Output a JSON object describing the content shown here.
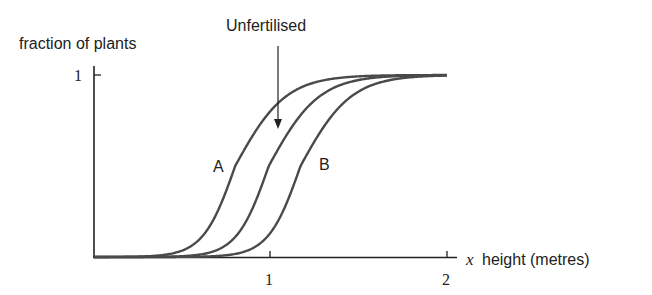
{
  "chart_data": {
    "type": "line",
    "title": "",
    "ylabel": "fraction of plants",
    "xlabel": "height (metres)",
    "xlabel_variable": "x",
    "xlim": [
      0,
      2.05
    ],
    "ylim": [
      0,
      1
    ],
    "x_ticks": [
      1,
      2
    ],
    "x_tick_labels": [
      "1",
      "2"
    ],
    "y_ticks": [
      1
    ],
    "y_tick_labels": [
      "1"
    ],
    "grid": false,
    "legend": "none (curves labelled directly)",
    "curve_model": "cumulative S-shaped (logistic-like) distribution, asymmetric: steeper rise, longer lower tail",
    "series": [
      {
        "name": "A",
        "label": "A",
        "midpoint": 0.8,
        "k_low": 11,
        "k_high": 7,
        "x": [
          0,
          0.2,
          0.4,
          0.6,
          0.7,
          0.8,
          0.9,
          1.0,
          1.2,
          1.5,
          2.0
        ],
        "values": [
          0.0,
          0.001,
          0.012,
          0.1,
          0.25,
          0.5,
          0.67,
          0.8,
          0.94,
          0.993,
          1.0
        ]
      },
      {
        "name": "Unfertilised",
        "label": "Unfertilised",
        "midpoint": 0.99,
        "k_low": 11,
        "k_high": 7,
        "x": [
          0,
          0.2,
          0.4,
          0.6,
          0.8,
          0.9,
          0.99,
          1.1,
          1.2,
          1.5,
          2.0
        ],
        "values": [
          0.0,
          0.0002,
          0.0015,
          0.014,
          0.11,
          0.27,
          0.5,
          0.68,
          0.81,
          0.97,
          0.999
        ]
      },
      {
        "name": "B",
        "label": "B",
        "midpoint": 1.17,
        "k_low": 11,
        "k_high": 7,
        "x": [
          0,
          0.4,
          0.6,
          0.8,
          1.0,
          1.1,
          1.17,
          1.3,
          1.5,
          1.8,
          2.0
        ],
        "values": [
          0.0,
          0.0002,
          0.0019,
          0.017,
          0.13,
          0.32,
          0.5,
          0.71,
          0.91,
          0.988,
          0.997
        ]
      }
    ],
    "annotations": [
      {
        "text": "Unfertilised",
        "type": "arrow-label",
        "points_to_series": "Unfertilised"
      },
      {
        "text": "A",
        "type": "curve-label",
        "series": "A"
      },
      {
        "text": "B",
        "type": "curve-label",
        "series": "B"
      }
    ]
  },
  "labels": {
    "ylabel": "fraction of plants",
    "xvar": "x",
    "xlabel": "height (metres)",
    "ytick_1": "1",
    "xtick_1": "1",
    "xtick_2": "2",
    "annotation_unfertilised": "Unfertilised",
    "curve_a": "A",
    "curve_b": "B"
  },
  "colors": {
    "curve": "#4a4a4a",
    "axis": "#222222",
    "text": "#222222"
  }
}
